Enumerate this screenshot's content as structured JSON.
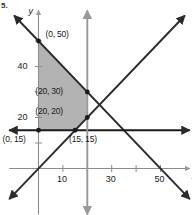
{
  "figure": {
    "number_partial": "5.",
    "axis_x_label": "x",
    "axis_y_label": "y"
  },
  "chart_data": {
    "type": "line",
    "title": "",
    "xlabel": "x",
    "ylabel": "y",
    "xlim": [
      -12,
      62
    ],
    "ylim": [
      -18,
      62
    ],
    "grid": false,
    "legend": null,
    "x_ticks": [
      10,
      20,
      30,
      40,
      50
    ],
    "x_tick_labels": [
      "10",
      "",
      "30",
      "",
      "50"
    ],
    "y_ticks": [
      10,
      20,
      30,
      40,
      50
    ],
    "y_tick_labels": [
      "",
      "20",
      "",
      "40",
      ""
    ],
    "series": [
      {
        "name": "x + y = 50",
        "kind": "line",
        "color": "#2b2b2b",
        "arrows": "both",
        "points": [
          [
            -10,
            60
          ],
          [
            62,
            -12
          ]
        ]
      },
      {
        "name": "y = x",
        "kind": "line",
        "color": "#2b2b2b",
        "arrows": "both",
        "points": [
          [
            -12,
            -12
          ],
          [
            60,
            60
          ]
        ]
      },
      {
        "name": "y = 15",
        "kind": "line",
        "color": "#1a1a1a",
        "arrows": "both",
        "points": [
          [
            -12,
            15
          ],
          [
            62,
            15
          ]
        ]
      },
      {
        "name": "x = 20",
        "kind": "line",
        "color": "#999999",
        "arrows": "both",
        "points": [
          [
            20,
            62
          ],
          [
            20,
            -18
          ]
        ]
      }
    ],
    "shaded_region": {
      "name": "feasible-region",
      "fill": "#a6a6a6",
      "opacity": 0.85,
      "vertices": [
        [
          0,
          50
        ],
        [
          20,
          30
        ],
        [
          20,
          20
        ],
        [
          15,
          15
        ],
        [
          0,
          15
        ]
      ]
    },
    "annotated_points": [
      {
        "label": "(0, 50)",
        "x": 0,
        "y": 50,
        "label_dx": 7,
        "label_dy": -12,
        "dot": true
      },
      {
        "label": "(20, 30)",
        "x": 20,
        "y": 30,
        "label_dx": -52,
        "label_dy": -6,
        "dot": true
      },
      {
        "label": "(20, 20)",
        "x": 20,
        "y": 20,
        "label_dx": -52,
        "label_dy": -12,
        "dot": true
      },
      {
        "label": "(15, 15)",
        "x": 15,
        "y": 15,
        "label_dx": -6,
        "label_dy": 4,
        "dot": true
      },
      {
        "label": "(0, 15)",
        "x": 0,
        "y": 15,
        "label_dx": -36,
        "label_dy": 4,
        "dot": true
      }
    ]
  }
}
